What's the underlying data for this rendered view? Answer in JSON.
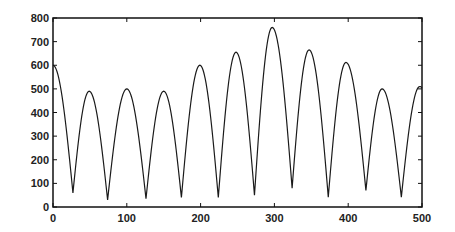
{
  "chart_data": {
    "type": "line",
    "title": "",
    "xlabel": "",
    "ylabel": "",
    "xlim": [
      0,
      500
    ],
    "ylim": [
      0,
      800
    ],
    "grid": false,
    "legend": null,
    "x_ticks": [
      0,
      100,
      200,
      300,
      400,
      500
    ],
    "y_ticks": [
      0,
      100,
      200,
      300,
      400,
      500,
      600,
      700,
      800
    ],
    "line_color": "#1a1a1a",
    "series": [
      {
        "name": "signal",
        "extrema": [
          {
            "x": 0,
            "y": 600,
            "kind": "start"
          },
          {
            "x": 27,
            "y": 60,
            "kind": "min"
          },
          {
            "x": 49,
            "y": 490,
            "kind": "max"
          },
          {
            "x": 74,
            "y": 30,
            "kind": "min"
          },
          {
            "x": 100,
            "y": 500,
            "kind": "max"
          },
          {
            "x": 126,
            "y": 35,
            "kind": "min"
          },
          {
            "x": 150,
            "y": 490,
            "kind": "max"
          },
          {
            "x": 174,
            "y": 40,
            "kind": "min"
          },
          {
            "x": 199,
            "y": 600,
            "kind": "max"
          },
          {
            "x": 224,
            "y": 40,
            "kind": "min"
          },
          {
            "x": 248,
            "y": 655,
            "kind": "max"
          },
          {
            "x": 273,
            "y": 50,
            "kind": "min"
          },
          {
            "x": 297,
            "y": 760,
            "kind": "max"
          },
          {
            "x": 324,
            "y": 80,
            "kind": "min"
          },
          {
            "x": 347,
            "y": 665,
            "kind": "max"
          },
          {
            "x": 373,
            "y": 42,
            "kind": "min"
          },
          {
            "x": 397,
            "y": 612,
            "kind": "max"
          },
          {
            "x": 424,
            "y": 70,
            "kind": "min"
          },
          {
            "x": 446,
            "y": 500,
            "kind": "max"
          },
          {
            "x": 472,
            "y": 42,
            "kind": "min"
          },
          {
            "x": 497,
            "y": 510,
            "kind": "max"
          },
          {
            "x": 500,
            "y": 505,
            "kind": "end"
          }
        ]
      }
    ]
  },
  "plot_area": {
    "left": 53,
    "top": 18,
    "right": 422,
    "bottom": 207
  }
}
